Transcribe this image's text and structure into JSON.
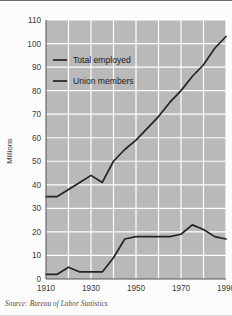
{
  "figure": {
    "source_note": "Source: Bureau of Labor Statistics",
    "plot_bg_color": "#b9b9b9",
    "gridline_color": "#ffffff",
    "line_color": "#242424",
    "page_bg_color": "#fcfcfc"
  },
  "chart_data": {
    "type": "line",
    "title": "",
    "xlabel": "",
    "ylabel": "Millions",
    "xlim": [
      1910,
      1990
    ],
    "ylim": [
      0,
      110
    ],
    "ytick_step": 10,
    "yticks": [
      0,
      10,
      20,
      30,
      40,
      50,
      60,
      70,
      80,
      90,
      100,
      110
    ],
    "ytick_labels": [
      "0",
      "10",
      "20",
      "30",
      "40",
      "50",
      "60",
      "70",
      "80",
      "90",
      "100",
      "110"
    ],
    "xticks": [
      1910,
      1930,
      1950,
      1970,
      1990
    ],
    "xtick_labels": [
      "1910",
      "1930",
      "1950",
      "1970",
      "1990"
    ],
    "x_gridlines": [
      1910,
      1920,
      1930,
      1940,
      1950,
      1960,
      1970,
      1980,
      1990
    ],
    "grid": true,
    "legend_position": "upper-left-inside",
    "series": [
      {
        "name": "Total employed",
        "x": [
          1910,
          1915,
          1920,
          1925,
          1930,
          1935,
          1940,
          1945,
          1950,
          1955,
          1960,
          1965,
          1970,
          1975,
          1980,
          1985,
          1990
        ],
        "values": [
          35,
          35,
          38,
          41,
          44,
          41,
          50,
          55,
          59,
          64,
          69,
          75,
          80,
          86,
          91,
          98,
          103
        ]
      },
      {
        "name": "Union members",
        "x": [
          1910,
          1915,
          1920,
          1925,
          1930,
          1935,
          1940,
          1945,
          1950,
          1955,
          1960,
          1965,
          1970,
          1975,
          1980,
          1985,
          1990
        ],
        "values": [
          2,
          2,
          5,
          3,
          3,
          3,
          9,
          17,
          18,
          18,
          18,
          18,
          19,
          23,
          21,
          18,
          17
        ]
      }
    ],
    "legend": [
      {
        "label": "Total employed"
      },
      {
        "label": "Union members"
      }
    ]
  }
}
